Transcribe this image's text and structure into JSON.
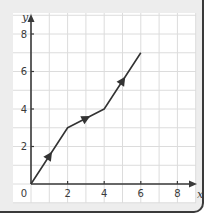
{
  "chart_data": {
    "type": "line",
    "title": "",
    "xlabel": "x",
    "ylabel": "y",
    "xlim": [
      0,
      8
    ],
    "ylim": [
      0,
      8
    ],
    "grid": true,
    "grid_step": 1,
    "x_ticks": [
      2,
      4,
      6,
      8
    ],
    "y_ticks": [
      2,
      4,
      6,
      8
    ],
    "origin_label": "0",
    "series": [
      {
        "name": "path",
        "x": [
          0,
          2,
          4,
          6
        ],
        "y": [
          0,
          3,
          4,
          7
        ],
        "direction_arrows": [
          {
            "x": 1,
            "y": 1.5
          },
          {
            "x": 3,
            "y": 3.5
          },
          {
            "x": 5,
            "y": 5.5
          }
        ]
      }
    ]
  },
  "colors": {
    "card_bg": "#ededed",
    "panel_bg": "#ffffff",
    "grid": "#dcdcdc",
    "axis": "#3a3a3a",
    "line": "#333333"
  }
}
